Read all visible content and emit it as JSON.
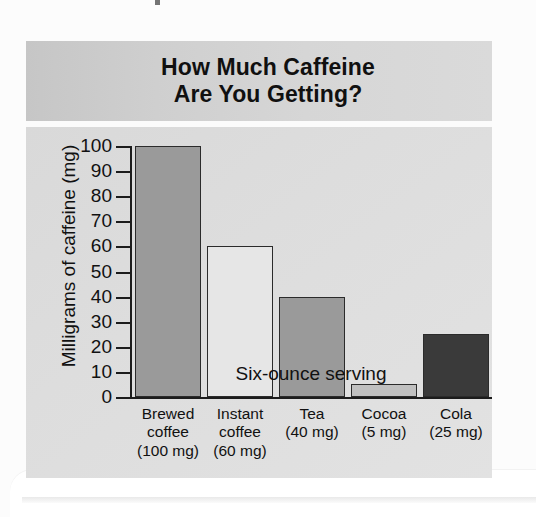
{
  "figure": {
    "title_line1": "How Much Caffeine",
    "title_line2": "Are You Getting?",
    "title": "How Much Caffeine\nAre You Getting?"
  },
  "colors": {
    "title_band": "#d2d2d2",
    "plot_background": "#dedede",
    "axis": "#1c1c1c",
    "text": "#111111",
    "bar_brewed_coffee": "#9a9a9a",
    "bar_instant_coffee": "#e6e6e6",
    "bar_tea": "#9a9a9a",
    "bar_cocoa": "#c0c0c0",
    "bar_cola": "#3a3a3a"
  },
  "chart_data": {
    "type": "bar",
    "title": "How Much Caffeine Are You Getting?",
    "xlabel": "Six-ounce serving",
    "ylabel": "Milligrams of caffeine (mg)",
    "ylim": [
      0,
      100
    ],
    "ytick_labels": [
      "100",
      "90",
      "80",
      "70",
      "60",
      "50",
      "40",
      "30",
      "20",
      "10",
      "0"
    ],
    "yticks": [
      100,
      90,
      80,
      70,
      60,
      50,
      40,
      30,
      20,
      10,
      0
    ],
    "grid": false,
    "legend": null,
    "categories": [
      "Brewed\ncoffee\n(100 mg)",
      "Instant\ncoffee\n(60 mg)",
      "Tea\n(40 mg)",
      "Cocoa\n(5 mg)",
      "Cola\n(25 mg)"
    ],
    "category_names": [
      "Brewed coffee",
      "Instant coffee",
      "Tea",
      "Cocoa",
      "Cola"
    ],
    "values": [
      100,
      60,
      40,
      5,
      25
    ],
    "bar_colors": [
      "#9a9a9a",
      "#e6e6e6",
      "#9a9a9a",
      "#c0c0c0",
      "#3a3a3a"
    ]
  }
}
